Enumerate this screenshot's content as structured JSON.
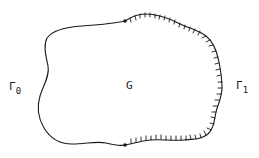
{
  "diagram": {
    "region": {
      "label": "G"
    },
    "boundaries": [
      {
        "id": "gamma0",
        "symbol": "Γ",
        "subscript": "0",
        "style": "plain",
        "side": "left"
      },
      {
        "id": "gamma1",
        "symbol": "Γ",
        "subscript": "1",
        "style": "hatched",
        "side": "right"
      }
    ],
    "junctions": [
      {
        "position": "top",
        "x": 125,
        "y": 21
      },
      {
        "position": "bottom",
        "x": 125,
        "y": 145
      }
    ],
    "colors": {
      "stroke": "#1a1a1a",
      "background": "#ffffff"
    }
  }
}
